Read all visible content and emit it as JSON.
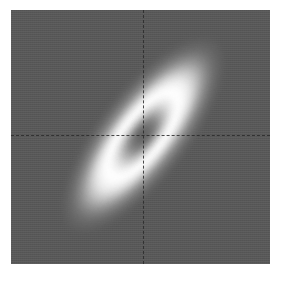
{
  "figure": {
    "title": "",
    "background_color": "#ffffff",
    "width": 287,
    "height": 284
  },
  "plot_area": {
    "left": 11,
    "top": 10,
    "width": 259,
    "height": 254,
    "background_color": "#585858",
    "border": "none"
  },
  "reference_lines": {
    "horizontal_label": "y = 0",
    "vertical_label": "x = 0",
    "style": "dashed",
    "color": "#2b2b2b",
    "center_x_px": 143,
    "center_y_px": 135
  },
  "chart_data": {
    "type": "heatmap",
    "subtype": "filled-contour",
    "title": "",
    "subtitle": "",
    "xlabel": "",
    "ylabel": "",
    "xticks": [],
    "yticks": [],
    "xlim": [
      -3,
      3
    ],
    "ylim": [
      -3,
      3
    ],
    "grid": false,
    "legend": "none",
    "colormap": "gray",
    "center": [
      0,
      0
    ],
    "ellipse_rotation_deg": -52,
    "correlation": 0.78,
    "sigma_major": 1.85,
    "sigma_minor": 0.62,
    "contour_levels": [
      0.05,
      0.15,
      0.25,
      0.35,
      0.45,
      0.55,
      0.65,
      0.75,
      0.85,
      0.95
    ],
    "level_colors": [
      "#606060",
      "#6d6d6d",
      "#7f7f7f",
      "#949494",
      "#ababab",
      "#c3c3c3",
      "#d9d9d9",
      "#ededed",
      "#fafafa",
      "#ffffff"
    ],
    "core_colors": [
      "#f2f2f2",
      "#dcdcdc",
      "#c2c2c2",
      "#a8a8a8",
      "#919191",
      "#7d7d7d",
      "#6e6e6e",
      "#636363",
      "#5b5b5b"
    ],
    "bands": [
      {
        "name": "outer-halo-1",
        "rx": 118,
        "ry": 44,
        "color": "#5f5f5f"
      },
      {
        "name": "outer-halo-2",
        "rx": 111,
        "ry": 41,
        "color": "#676767"
      },
      {
        "name": "outer-halo-3",
        "rx": 104,
        "ry": 38,
        "color": "#727272"
      },
      {
        "name": "outer-halo-4",
        "rx": 98,
        "ry": 35,
        "color": "#828282"
      },
      {
        "name": "mid-ring-1",
        "rx": 92,
        "ry": 32,
        "color": "#969696"
      },
      {
        "name": "mid-ring-2",
        "rx": 86,
        "ry": 29,
        "color": "#aeaeae"
      },
      {
        "name": "mid-ring-3",
        "rx": 80,
        "ry": 27,
        "color": "#c6c6c6"
      },
      {
        "name": "mid-ring-4",
        "rx": 74,
        "ry": 25,
        "color": "#dcdcdc"
      },
      {
        "name": "bright-ring-1",
        "rx": 68,
        "ry": 23,
        "color": "#efefef"
      },
      {
        "name": "bright-ring-2",
        "rx": 61,
        "ry": 21,
        "color": "#fbfbfb"
      },
      {
        "name": "bright-ring-3",
        "rx": 54,
        "ry": 19,
        "color": "#ffffff"
      },
      {
        "name": "inner-fade-1",
        "rx": 47,
        "ry": 17,
        "color": "#f4f4f4"
      },
      {
        "name": "inner-fade-2",
        "rx": 41,
        "ry": 15,
        "color": "#e2e2e2"
      },
      {
        "name": "inner-fade-3",
        "rx": 35,
        "ry": 13,
        "color": "#cbcbcb"
      },
      {
        "name": "inner-fade-4",
        "rx": 30,
        "ry": 11,
        "color": "#b2b2b2"
      },
      {
        "name": "core-ring-1",
        "rx": 25,
        "ry": 9,
        "color": "#9a9a9a"
      },
      {
        "name": "core-ring-2",
        "rx": 20,
        "ry": 8,
        "color": "#868686"
      },
      {
        "name": "core-ring-3",
        "rx": 16,
        "ry": 6,
        "color": "#767676"
      },
      {
        "name": "core-ring-4",
        "rx": 11,
        "ry": 5,
        "color": "#6a6a6a"
      },
      {
        "name": "core-center",
        "rx": 6,
        "ry": 3,
        "color": "#5e5e5e"
      }
    ]
  }
}
